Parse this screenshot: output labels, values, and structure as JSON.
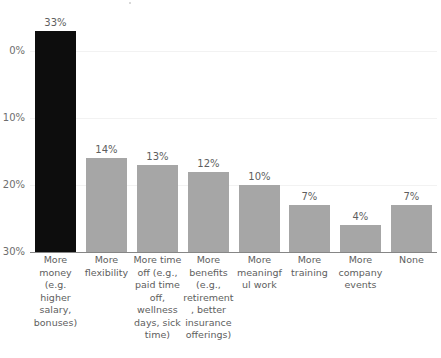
{
  "chart_data": {
    "type": "bar",
    "title": "",
    "subtitle": "",
    "xlabel": "",
    "ylabel": "",
    "ylim": [
      0,
      33
    ],
    "grid": true,
    "legend": "none",
    "orientation": "vertical",
    "value_suffix": "%",
    "categories": [
      "More money (e.g. higher salary, bonuses)",
      "More flexibility",
      "More time off (e.g., paid time off, wellness days, sick time)",
      "More benefits (e.g., retirement, better insurance offerings)",
      "More meaningful work",
      "More training",
      "More company events",
      "None"
    ],
    "values": [
      33,
      14,
      13,
      12,
      10,
      7,
      4,
      7
    ],
    "value_labels": [
      "33%",
      "14%",
      "13%",
      "12%",
      "10%",
      "7%",
      "4%",
      "7%"
    ],
    "bar_colors": [
      "#0d0d0d",
      "#a6a6a6",
      "#a6a6a6",
      "#a6a6a6",
      "#a6a6a6",
      "#a6a6a6",
      "#a6a6a6",
      "#a6a6a6"
    ],
    "highlight_index": 0,
    "y_ticks": [
      0,
      10,
      20,
      30
    ],
    "y_tick_labels": [
      "0%",
      "10%",
      "20%",
      "30%"
    ],
    "axis_color": "#868686",
    "gridline_color": "#f2f2f2",
    "text_color": "#5e5e5e",
    "background_color": "#ffffff"
  }
}
